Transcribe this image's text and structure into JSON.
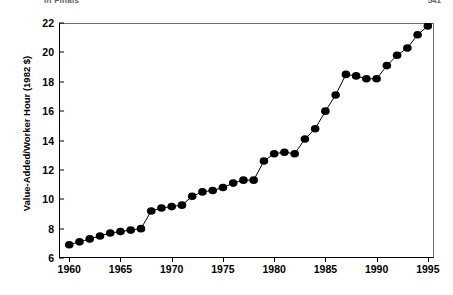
{
  "header": {
    "left_text": "in Finals",
    "right_text": "541"
  },
  "chart_data": {
    "type": "line",
    "title": "",
    "xlabel": "",
    "ylabel": "Value-Added/Worker Hour (1982 $)",
    "xlim": [
      1959,
      1995.6
    ],
    "ylim": [
      6,
      22
    ],
    "xticks": [
      1960,
      1965,
      1970,
      1975,
      1980,
      1985,
      1990,
      1995
    ],
    "yticks": [
      6,
      8,
      10,
      12,
      14,
      16,
      18,
      20,
      22
    ],
    "grid": false,
    "legend": null,
    "marker": "filled-circle",
    "marker_color": "#000000",
    "line_color": "#000000",
    "x": [
      1960,
      1961,
      1962,
      1963,
      1964,
      1965,
      1966,
      1967,
      1968,
      1969,
      1970,
      1971,
      1972,
      1973,
      1974,
      1975,
      1976,
      1977,
      1978,
      1979,
      1980,
      1981,
      1982,
      1983,
      1984,
      1985,
      1986,
      1987,
      1988,
      1989,
      1990,
      1991,
      1992,
      1993,
      1994,
      1995
    ],
    "values": [
      6.9,
      7.1,
      7.3,
      7.5,
      7.7,
      7.8,
      7.9,
      8.0,
      9.2,
      9.4,
      9.5,
      9.6,
      10.2,
      10.5,
      10.6,
      10.8,
      11.1,
      11.3,
      11.3,
      12.6,
      13.1,
      13.2,
      13.1,
      14.1,
      14.8,
      16.0,
      17.1,
      18.5,
      18.4,
      18.2,
      18.2,
      19.1,
      19.8,
      20.3,
      21.2,
      21.8
    ]
  }
}
